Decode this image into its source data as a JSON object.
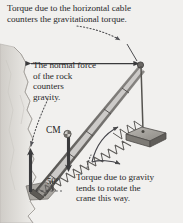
{
  "figure": {
    "background_color": "#f1f0ee",
    "ink_color": "#3a3a3c",
    "rock_color": "#d8d6d2",
    "captions": {
      "cable_torque": "Torque due to the horizontal cable\ncounters the gravitational torque.",
      "normal_force": "The normal force\nof the rock\ncounters\ngravity.",
      "gravity_torque": "Torque due to gravity\ntends to rotate the\ncrane this way."
    },
    "labels": {
      "center_of_mass": "CM",
      "boom_angle": "50°"
    },
    "parts": {
      "rock_cliff": "rock-cliff",
      "horizontal_cable": "horizontal-cable",
      "crane_boom": "crane-boom-truss",
      "hoist_cable": "hoist-cable",
      "load_block": "suspended-load",
      "normal_force_arrow": "normal-force-arrow",
      "weight_arrow": "weight-arrow",
      "rotation_arrow": "rotation-direction-arrow",
      "cm_marker": "center-of-mass-marker"
    }
  }
}
